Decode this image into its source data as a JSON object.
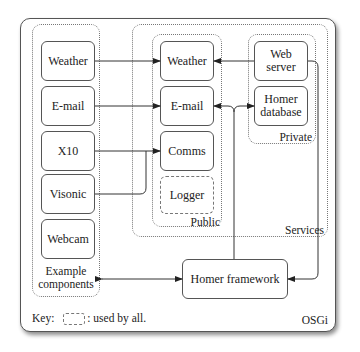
{
  "diagram": {
    "container_label": "OSGi",
    "groups": {
      "example_components": {
        "label_line1": "Example",
        "label_line2": "components"
      },
      "services": {
        "label": "Services"
      },
      "public": {
        "label": "Public"
      },
      "private": {
        "label": "Private"
      }
    },
    "example_components": [
      {
        "label": "Weather"
      },
      {
        "label": "E-mail"
      },
      {
        "label": "X10"
      },
      {
        "label": "Visonic"
      },
      {
        "label": "Webcam"
      }
    ],
    "public_services": [
      {
        "label": "Weather"
      },
      {
        "label": "E-mail"
      },
      {
        "label": "Comms"
      },
      {
        "label": "Logger",
        "style": "dashed"
      }
    ],
    "private_services": [
      {
        "label_line1": "Web",
        "label_line2": "server"
      },
      {
        "label_line1": "Homer",
        "label_line2": "database"
      }
    ],
    "framework": {
      "label": "Homer framework"
    },
    "key": {
      "prefix": "Key:",
      "suffix": ": used by all."
    },
    "edges": [
      {
        "from": "Weather (component)",
        "to": "Weather (service)",
        "type": "arrow"
      },
      {
        "from": "E-mail (component)",
        "to": "E-mail (service)",
        "type": "arrow"
      },
      {
        "from": "X10",
        "to": "Comms",
        "type": "arrow"
      },
      {
        "from": "Visonic",
        "to": "Comms",
        "type": "arrow"
      },
      {
        "from": "Web server",
        "to": "Weather (service)",
        "type": "arrow"
      },
      {
        "from": "Homer framework",
        "to": "E-mail (service)",
        "type": "arrow"
      },
      {
        "from": "Homer framework",
        "to": "Homer database",
        "type": "arrow"
      },
      {
        "from": "Web server",
        "to": "Homer framework",
        "type": "arrow"
      },
      {
        "from": "Example components",
        "to": "Homer framework",
        "type": "bidirectional"
      }
    ]
  }
}
